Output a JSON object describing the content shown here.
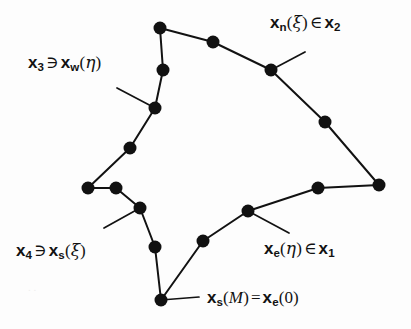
{
  "figure": {
    "background_color": "#fdfdfd",
    "ink_color": "#121212",
    "node_color": "#111111",
    "node_radius": 6.5,
    "stroke_width": 2.0
  },
  "labels": {
    "north": {
      "id": "label-n",
      "text": "x_n(xi) in x_2",
      "var": "x",
      "sub": "n",
      "open": "(",
      "arg": "ξ",
      "close": ")",
      "op": "∈",
      "var2": "x",
      "sub2": "2"
    },
    "west": {
      "id": "label-w",
      "text": "x_3 ni x_w(eta)",
      "var": "x",
      "sub": "3",
      "op": "∋",
      "var2": "x",
      "sub2": "w",
      "open": "(",
      "arg": "η",
      "close": ")"
    },
    "south_set": {
      "id": "label-s4",
      "text": "x_4 ni x_s(xi)",
      "var": "x",
      "sub": "4",
      "op": "∋",
      "var2": "x",
      "sub2": "s",
      "open": "(",
      "arg": "ξ",
      "close": ")"
    },
    "east": {
      "id": "label-e",
      "text": "x_e(eta) in x_1",
      "var": "x",
      "sub": "e",
      "open": "(",
      "arg": "η",
      "close": ")",
      "op": "∈",
      "var2": "x",
      "sub2": "1"
    },
    "corner": {
      "id": "label-sm",
      "text": "x_s(M) = x_e(0)",
      "var": "x",
      "sub": "s",
      "open": "(",
      "arg": "M",
      "close": ")",
      "op": "=",
      "var2": "x",
      "sub2": "e",
      "open2": "(",
      "arg2": "0",
      "close2": ")"
    }
  },
  "geometry": {
    "nodes": [
      {
        "name": "node-top-apex",
        "x": 160,
        "y": 28
      },
      {
        "name": "node-top-mid",
        "x": 213,
        "y": 42
      },
      {
        "name": "node-north",
        "x": 271,
        "y": 70
      },
      {
        "name": "node-right-upper",
        "x": 325,
        "y": 122
      },
      {
        "name": "node-right-corner",
        "x": 379,
        "y": 185
      },
      {
        "name": "node-right-lower",
        "x": 318,
        "y": 188
      },
      {
        "name": "node-east",
        "x": 248,
        "y": 211
      },
      {
        "name": "node-southeast",
        "x": 203,
        "y": 241
      },
      {
        "name": "node-bottom-apex",
        "x": 161,
        "y": 300
      },
      {
        "name": "node-south-lower",
        "x": 155,
        "y": 247
      },
      {
        "name": "node-south",
        "x": 140,
        "y": 208
      },
      {
        "name": "node-left-inner",
        "x": 116,
        "y": 188
      },
      {
        "name": "node-left-corner",
        "x": 88,
        "y": 188
      },
      {
        "name": "node-left-lower-mid",
        "x": 130,
        "y": 148
      },
      {
        "name": "node-west",
        "x": 155,
        "y": 108
      },
      {
        "name": "node-left-upper",
        "x": 163,
        "y": 70
      }
    ],
    "boundary_path": "M160,28 L213,42 L271,70 L325,122 L379,185 L318,188 L248,211 L203,241 L161,300 L155,247 L140,208 L116,188 L88,188 L130,148 L155,108 L163,70 Z",
    "leaders": [
      {
        "name": "leader-north",
        "x1": 271,
        "y1": 70,
        "x2": 305,
        "y2": 52
      },
      {
        "name": "leader-west",
        "x1": 155,
        "y1": 108,
        "x2": 117,
        "y2": 88
      },
      {
        "name": "leader-south",
        "x1": 140,
        "y1": 208,
        "x2": 104,
        "y2": 228
      },
      {
        "name": "leader-east",
        "x1": 248,
        "y1": 211,
        "x2": 289,
        "y2": 233
      },
      {
        "name": "leader-corner",
        "x1": 161,
        "y1": 300,
        "x2": 199,
        "y2": 297
      }
    ]
  }
}
